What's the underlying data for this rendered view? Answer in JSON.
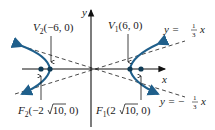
{
  "diagram": {
    "type": "hyperbola",
    "axes": {
      "x_label": "x",
      "y_label": "y"
    },
    "colors": {
      "curve": "#1f5f8b",
      "asymptote": "#333333",
      "axis": "#111111",
      "point": "#0e3a55"
    },
    "labels": {
      "v2": {
        "name": "V",
        "sub": "2",
        "coords": "(−6, 0)"
      },
      "v1": {
        "name": "V",
        "sub": "1",
        "coords": "(6, 0)"
      },
      "f2": {
        "name": "F",
        "sub": "2",
        "pre": "(−2",
        "root": "10",
        "post": ", 0)"
      },
      "f1": {
        "name": "F",
        "sub": "1",
        "pre": "(2",
        "root": "10",
        "post": ", 0)"
      },
      "asym_pos": {
        "lhs": "y = ",
        "num": "1",
        "den": "3",
        "var": "x"
      },
      "asym_neg": {
        "lhs": "y = −",
        "num": "1",
        "den": "3",
        "var": "x"
      }
    },
    "points": [
      {
        "id": "V2",
        "x": -6,
        "y": 0
      },
      {
        "id": "V1",
        "x": 6,
        "y": 0
      },
      {
        "id": "F2",
        "x": "-2√10",
        "y": 0
      },
      {
        "id": "F1",
        "x": "2√10",
        "y": 0
      }
    ],
    "asymptotes": [
      "y = 1/3 x",
      "y = -1/3 x"
    ]
  }
}
